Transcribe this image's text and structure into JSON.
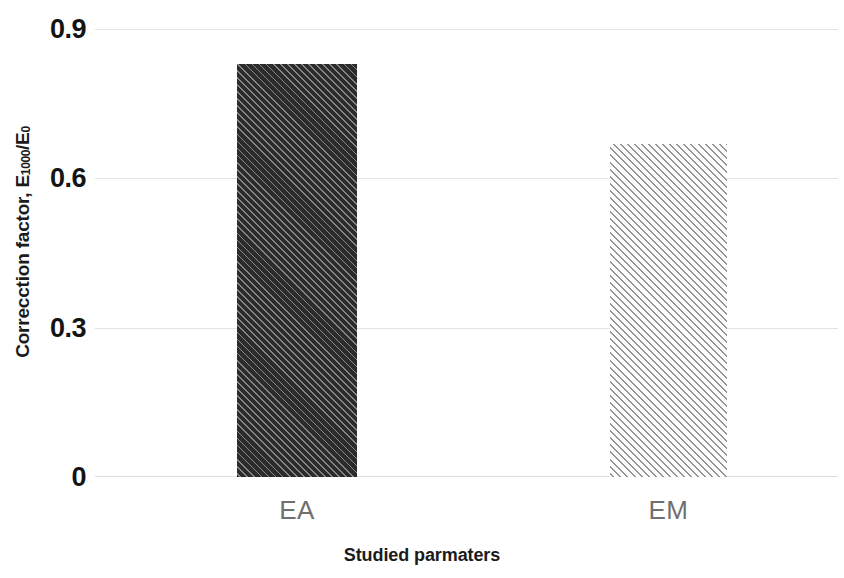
{
  "chart_data": {
    "type": "bar",
    "title": "",
    "subtitle": "",
    "categories": [
      "EA",
      "EM"
    ],
    "values": [
      0.83,
      0.67
    ],
    "series": [
      {
        "name": "Correcction factor",
        "values": [
          0.83,
          0.67
        ]
      }
    ],
    "xlabel": "Studied parmaters",
    "ylabel_full": "Correcction factor, E1000/E0",
    "ylabel_main": "Correcction factor, E",
    "ylabel_sub1": "1000",
    "ylabel_mid": "/E",
    "ylabel_sub2": "0",
    "ylim": [
      0,
      0.9
    ],
    "yticks": [
      "0.9",
      "0.6",
      "0.3",
      "0"
    ],
    "ytick_values": [
      0.9,
      0.6,
      0.3,
      0
    ],
    "grid": true,
    "grid_axis": "y",
    "legend": false,
    "legend_position": "none",
    "bar_fills": [
      "dark-diagonal-hatch",
      "light-diagonal-hatch"
    ],
    "colors": {
      "bar_ea": "#2b2b2b",
      "bar_em": "#fdfdfd",
      "hatch_ea": "#969696",
      "hatch_em": "#767678",
      "gridline": "#e3e3e5",
      "tick_label": "#141414",
      "category_label": "#6f6f6f",
      "axis_title": "#1b1b1b",
      "background": "#ffffff"
    }
  }
}
